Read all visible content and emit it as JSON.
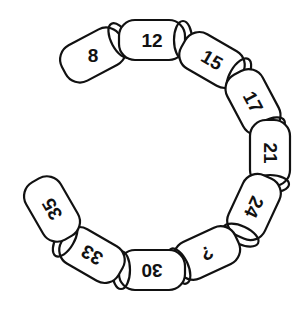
{
  "puzzle": {
    "type": "number-chain",
    "links": [
      {
        "label": "8",
        "cx": 93,
        "cy": 55,
        "angle": -28,
        "text_angle": 0
      },
      {
        "label": "12",
        "cx": 152,
        "cy": 40,
        "angle": 0,
        "text_angle": 0
      },
      {
        "label": "15",
        "cx": 212,
        "cy": 60,
        "angle": 30,
        "text_angle": 30
      },
      {
        "label": "17",
        "cx": 253,
        "cy": 102,
        "angle": 62,
        "text_angle": 62
      },
      {
        "label": "21",
        "cx": 270,
        "cy": 153,
        "angle": 90,
        "text_angle": 90
      },
      {
        "label": "24",
        "cx": 254,
        "cy": 207,
        "angle": 115,
        "text_angle": 115
      },
      {
        "label": "?",
        "cx": 207,
        "cy": 253,
        "angle": 155,
        "text_angle": 155
      },
      {
        "label": "30",
        "cx": 152,
        "cy": 270,
        "angle": 180,
        "text_angle": 180
      },
      {
        "label": "33",
        "cx": 92,
        "cy": 255,
        "angle": 210,
        "text_angle": 210
      },
      {
        "label": "35",
        "cx": 52,
        "cy": 209,
        "angle": 240,
        "text_angle": 240
      }
    ]
  }
}
